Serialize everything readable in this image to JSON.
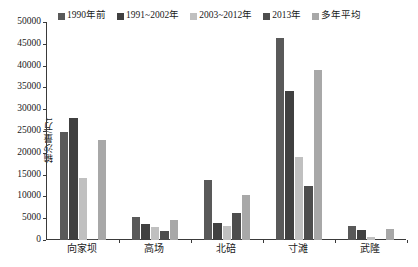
{
  "chart_data": {
    "type": "bar",
    "title": "",
    "xlabel": "",
    "ylabel": "输沙量/万t",
    "ylim": [
      0,
      50000
    ],
    "ytick_step": 5000,
    "yticks": [
      "0",
      "5000",
      "10000",
      "15000",
      "20000",
      "25000",
      "30000",
      "35000",
      "40000",
      "45000",
      "50000"
    ],
    "grid": false,
    "legend_position": "top",
    "categories": [
      "向家坝",
      "高场",
      "北碚",
      "寸滩",
      "武隆"
    ],
    "series": [
      {
        "name": "1990年前",
        "color": "#595959",
        "values": [
          24700,
          5300,
          13700,
          46300,
          3300
        ]
      },
      {
        "name": "1991~2002年",
        "color": "#404040",
        "values": [
          28000,
          3600,
          4000,
          34100,
          2300
        ]
      },
      {
        "name": "2003~2012年",
        "color": "#c0c0c0",
        "values": [
          14200,
          3000,
          3200,
          19100,
          700
        ]
      },
      {
        "name": "2013年",
        "color": "#4d4d4d",
        "values": [
          200,
          2100,
          6100,
          12500,
          0
        ]
      },
      {
        "name": "多年平均",
        "color": "#a8a8a8",
        "values": [
          23000,
          4500,
          10400,
          38900,
          2500
        ]
      }
    ]
  }
}
